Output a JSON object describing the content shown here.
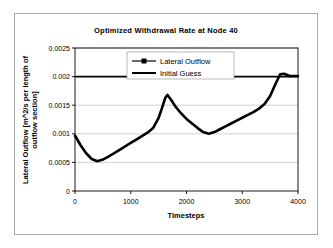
{
  "chart_data": {
    "type": "line",
    "title": "Optimized Withdrawal Rate at Node 40",
    "xlabel": "Timesteps",
    "ylabel": "Lateral Outflow [m^2/s per length of outflow section]",
    "xlim": [
      0,
      4000
    ],
    "ylim": [
      0,
      0.0025
    ],
    "xticks": [
      0,
      1000,
      2000,
      3000,
      4000
    ],
    "xtick_labels": [
      "0",
      "1000",
      "2000",
      "3000",
      "4000"
    ],
    "yticks": [
      0,
      0.0005,
      0.001,
      0.0015,
      0.002,
      0.0025
    ],
    "ytick_labels": [
      "0",
      "0.0005",
      "0.001",
      "0.0015",
      "0.002",
      "0.0025"
    ],
    "grid": "horizontal",
    "legend_position": "top-center-inside",
    "series": [
      {
        "name": "Lateral Outflow",
        "color": "#000000",
        "marker": "square",
        "x": [
          0,
          100,
          200,
          300,
          400,
          500,
          600,
          700,
          800,
          900,
          1000,
          1100,
          1200,
          1300,
          1400,
          1500,
          1560,
          1620,
          1660,
          1720,
          1800,
          1900,
          2000,
          2100,
          2200,
          2300,
          2400,
          2500,
          2600,
          2700,
          2800,
          2900,
          3000,
          3100,
          3200,
          3300,
          3400,
          3500,
          3600,
          3680,
          3750,
          3850,
          4000
        ],
        "y": [
          0.00097,
          0.0008,
          0.00066,
          0.00056,
          0.00052,
          0.00055,
          0.0006,
          0.00066,
          0.00072,
          0.00078,
          0.00084,
          0.0009,
          0.00096,
          0.00102,
          0.0011,
          0.00128,
          0.00145,
          0.00163,
          0.00168,
          0.0016,
          0.00148,
          0.00136,
          0.00126,
          0.00118,
          0.0011,
          0.00103,
          0.001,
          0.00103,
          0.00108,
          0.00113,
          0.00118,
          0.00123,
          0.00128,
          0.00133,
          0.00138,
          0.00144,
          0.00152,
          0.00166,
          0.00188,
          0.00204,
          0.00205,
          0.00201,
          0.00201
        ]
      },
      {
        "name": "Initial Guess",
        "color": "#000000",
        "marker": "none",
        "constant_value": 0.002,
        "x": [
          0,
          4000
        ],
        "y": [
          0.002,
          0.002
        ]
      }
    ]
  },
  "legend": {
    "items": [
      {
        "label": "Lateral Outflow"
      },
      {
        "label": "Initial Guess"
      }
    ]
  }
}
